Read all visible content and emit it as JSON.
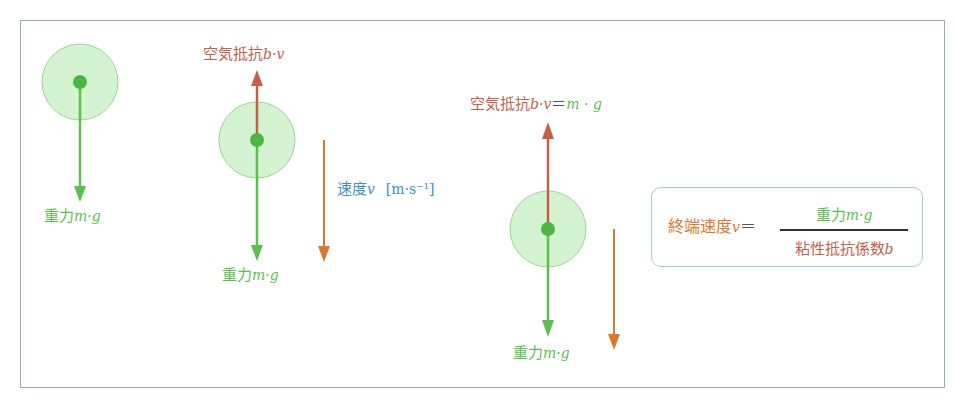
{
  "diagram": {
    "colors": {
      "gravity": "#5cbf4f",
      "air_resistance": "#c4604a",
      "velocity_label": "#3e8fc9",
      "velocity_arrow": "#d9792f",
      "ball_fill": "#c9f0c4",
      "ball_center": "#4cb544",
      "frame": "#8fb89a",
      "formula_border": "#9fcde3"
    },
    "stage1": {
      "gravity_label": "重力",
      "gravity_math": "m·g"
    },
    "stage2": {
      "air_label": "空気抵抗",
      "air_math": "b·v",
      "gravity_label": "重力",
      "gravity_math": "m·g",
      "velocity_label": "速度",
      "velocity_math": "v",
      "velocity_unit": "[m·s⁻¹]"
    },
    "stage3": {
      "air_label": "空気抵抗",
      "air_math": "b·v",
      "equals": "＝",
      "balance_math": "m · g",
      "gravity_label": "重力",
      "gravity_math": "m·g"
    },
    "formula": {
      "lhs_label": "終端速度",
      "lhs_math": "v",
      "equals": "＝",
      "numerator_label": "重力",
      "numerator_math": "m·g",
      "denominator_label": "粘性抵抗係数",
      "denominator_math": "b"
    }
  }
}
